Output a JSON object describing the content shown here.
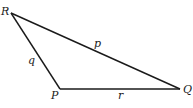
{
  "diagram": {
    "type": "triangle",
    "vertices": [
      {
        "name": "R",
        "x": 11,
        "y": 13
      },
      {
        "name": "P",
        "x": 60,
        "y": 89
      },
      {
        "name": "Q",
        "x": 180,
        "y": 89
      }
    ],
    "sides": [
      {
        "name": "p",
        "from": "R",
        "to": "Q"
      },
      {
        "name": "q",
        "from": "R",
        "to": "P"
      },
      {
        "name": "r",
        "from": "P",
        "to": "Q"
      }
    ],
    "labels": {
      "R": "R",
      "P": "P",
      "Q": "Q",
      "p": "p",
      "q": "q",
      "r": "r"
    },
    "stroke_color": "#1a1a1a"
  }
}
